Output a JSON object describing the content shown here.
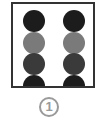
{
  "figure": {
    "frame": {
      "border_color": "#333333"
    },
    "columns": [
      {
        "name": "left",
        "circles": [
          {
            "row": 1,
            "color": "#1c1c1c"
          },
          {
            "row": 2,
            "color": "#7a7a7a"
          },
          {
            "row": 3,
            "color": "#3a3a3a"
          },
          {
            "row": 4,
            "color": "#1c1c1c",
            "partial": true
          }
        ]
      },
      {
        "name": "right",
        "circles": [
          {
            "row": 1,
            "color": "#1c1c1c"
          },
          {
            "row": 2,
            "color": "#7a7a7a"
          },
          {
            "row": 3,
            "color": "#3a3a3a"
          },
          {
            "row": 4,
            "color": "#1c1c1c",
            "partial": true
          }
        ]
      }
    ],
    "badge": {
      "label": "1",
      "color": "#9a9a9a"
    }
  }
}
